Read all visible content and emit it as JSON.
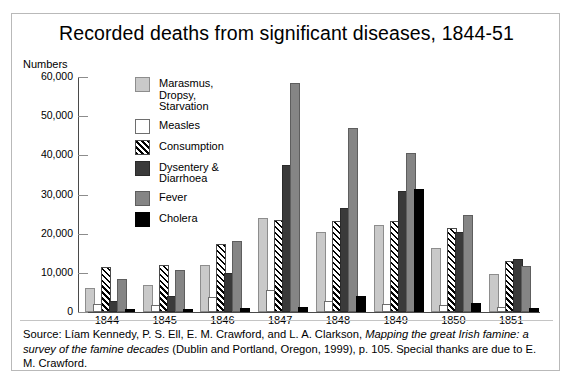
{
  "chart_data": {
    "type": "bar",
    "title": "Recorded deaths from significant diseases, 1844-51",
    "xlabel": "",
    "ylabel": "Numbers",
    "ylim": [
      0,
      60000
    ],
    "yticks": [
      0,
      10000,
      20000,
      30000,
      40000,
      50000,
      60000
    ],
    "ytick_labels": [
      "0",
      "10,000",
      "20,000",
      "30,000",
      "40,000",
      "50,000",
      "60,000"
    ],
    "grid": false,
    "legend_position": "inside-upper-left",
    "categories": [
      "1844",
      "1845",
      "1846",
      "1847",
      "1848",
      "1849",
      "1850",
      "1851"
    ],
    "series": [
      {
        "name": "Marasmus,\nDropsy,\nStarvation",
        "legend_label": "Marasmus,\nDropsy,\nStarvation",
        "color": "#c9c9c9",
        "values": [
          5700,
          6500,
          11500,
          23500,
          20000,
          21700,
          15800,
          9300
        ]
      },
      {
        "name": "Measles",
        "legend_label": "Measles",
        "color": "#ffffff",
        "values": [
          1600,
          1200,
          3200,
          5000,
          2300,
          1500,
          1200,
          800
        ]
      },
      {
        "name": "Consumption",
        "legend_label": "Consumption",
        "color": "#ffffff",
        "hatch": "///",
        "values": [
          11000,
          11500,
          16800,
          23000,
          22800,
          22800,
          21000,
          12500
        ]
      },
      {
        "name": "Dysentery & Diarrhoea",
        "legend_label": "Dysentery &\nDiarrhoea",
        "color": "#3a3a3a",
        "values": [
          2200,
          3500,
          9500,
          37000,
          26000,
          30500,
          20000,
          13000
        ]
      },
      {
        "name": "Fever",
        "legend_label": "Fever",
        "color": "#858585",
        "values": [
          7800,
          10200,
          17500,
          58000,
          46500,
          40000,
          24300,
          11200
        ]
      },
      {
        "name": "Cholera",
        "legend_label": "Cholera",
        "color": "#000000",
        "values": [
          300,
          300,
          500,
          700,
          3700,
          31000,
          1800,
          400
        ]
      }
    ]
  },
  "source": {
    "prefix": "Source: Líam Kennedy, P. S. Ell, E. M. Crawford, and L. A. Clarkson, ",
    "italic_title": "Mapping the great Irish famine: a survey of the famine decades",
    "suffix": " (Dublin and Portland, Oregon, 1999), p. 105. Special thanks are due to E. M. Crawford."
  }
}
